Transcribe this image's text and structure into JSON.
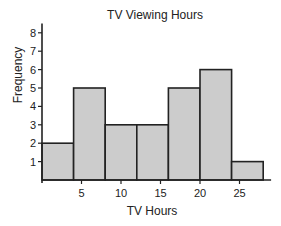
{
  "chart_data": {
    "type": "bar",
    "subtype": "histogram",
    "title": "TV Viewing Hours",
    "xlabel": "TV Hours",
    "ylabel": "Frequency",
    "bin_edges": [
      0,
      4,
      8,
      12,
      16,
      20,
      24,
      28
    ],
    "categories": [
      "0-4",
      "4-8",
      "8-12",
      "12-16",
      "16-20",
      "20-24",
      "24-28"
    ],
    "values": [
      2,
      5,
      3,
      3,
      5,
      6,
      1
    ],
    "x_ticks": [
      5,
      10,
      15,
      20,
      25
    ],
    "y_ticks": [
      1,
      2,
      3,
      4,
      5,
      6,
      7,
      8
    ],
    "xlim": [
      0,
      29
    ],
    "ylim": [
      0,
      8.5
    ],
    "grid": false,
    "legend": null,
    "bar_color": "#cccccc",
    "edge_color": "#222222"
  }
}
